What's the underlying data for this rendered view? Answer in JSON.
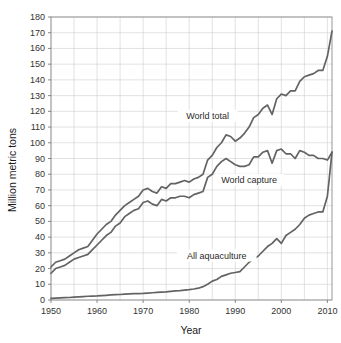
{
  "chart_data": {
    "type": "line",
    "title": "",
    "xlabel": "Year",
    "ylabel": "Million metric tons",
    "xlim": [
      1950,
      2011
    ],
    "ylim": [
      0,
      180
    ],
    "xticks": [
      1950,
      1960,
      1970,
      1980,
      1990,
      2000,
      2010
    ],
    "yticks": [
      0,
      10,
      20,
      30,
      40,
      50,
      60,
      70,
      80,
      90,
      100,
      110,
      120,
      130,
      140,
      150,
      160,
      170,
      180
    ],
    "grid": true,
    "legend_position": "inline-annotations",
    "x": [
      1950,
      1951,
      1952,
      1953,
      1954,
      1955,
      1956,
      1957,
      1958,
      1959,
      1960,
      1961,
      1962,
      1963,
      1964,
      1965,
      1966,
      1967,
      1968,
      1969,
      1970,
      1971,
      1972,
      1973,
      1974,
      1975,
      1976,
      1977,
      1978,
      1979,
      1980,
      1981,
      1982,
      1983,
      1984,
      1985,
      1986,
      1987,
      1988,
      1989,
      1990,
      1991,
      1992,
      1993,
      1994,
      1995,
      1996,
      1997,
      1998,
      1999,
      2000,
      2001,
      2002,
      2003,
      2004,
      2005,
      2006,
      2007,
      2008,
      2009,
      2010,
      2011
    ],
    "series": [
      {
        "name": "World total",
        "color": "#636363",
        "label": "World total",
        "values": [
          21,
          24,
          25,
          26,
          28,
          30,
          32,
          33,
          34,
          38,
          42,
          45,
          48,
          50,
          54,
          57,
          60,
          62,
          64,
          66,
          70,
          71,
          69,
          68,
          72,
          71,
          74,
          74,
          75,
          76,
          75,
          77,
          78,
          80,
          89,
          92,
          97,
          100,
          105,
          104,
          101,
          103,
          106,
          110,
          116,
          118,
          122,
          124,
          118,
          128,
          131,
          130,
          133,
          133,
          139,
          142,
          143,
          144,
          146,
          146,
          155,
          171
        ]
      },
      {
        "name": "World capture",
        "color": "#8a8a8a",
        "label": "World capture",
        "values": [
          17,
          20,
          21,
          22,
          24,
          26,
          27,
          28,
          29,
          32,
          35,
          38,
          41,
          43,
          47,
          49,
          53,
          55,
          57,
          58,
          62,
          63,
          61,
          60,
          64,
          63,
          65,
          65,
          66,
          66,
          65,
          67,
          68,
          69,
          78,
          80,
          85,
          88,
          90,
          88,
          86,
          85,
          85,
          86,
          91,
          91,
          94,
          95,
          87,
          95,
          96,
          93,
          93,
          90,
          95,
          94,
          92,
          92,
          90,
          90,
          89,
          94
        ]
      },
      {
        "name": "All aquaculture",
        "color": "#636363",
        "label": "All aquaculture",
        "values": [
          1,
          1.2,
          1.4,
          1.5,
          1.6,
          1.8,
          2,
          2.2,
          2.4,
          2.5,
          2.6,
          2.8,
          3,
          3.2,
          3.4,
          3.5,
          3.8,
          3.9,
          4,
          4.1,
          4.2,
          4.4,
          4.6,
          4.8,
          5,
          5.2,
          5.5,
          5.8,
          6,
          6.3,
          6.6,
          7,
          7.5,
          8.5,
          10,
          12,
          13,
          15,
          16,
          17,
          17.5,
          18,
          21,
          24,
          26,
          28,
          31,
          34,
          36,
          39,
          36,
          41,
          43,
          45,
          48,
          52,
          54,
          55,
          56,
          56,
          66,
          94
        ]
      }
    ],
    "annotations": [
      {
        "text": "World total",
        "x": 1984,
        "y": 116
      },
      {
        "text": "World capture",
        "x": 1993,
        "y": 75
      },
      {
        "text": "All aquaculture",
        "x": 1986,
        "y": 27
      }
    ]
  }
}
